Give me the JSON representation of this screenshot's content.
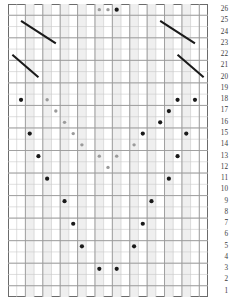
{
  "chart": {
    "columns": 23,
    "rows": 26,
    "cell_width": 8.7,
    "cell_height": 11.27,
    "grid_left": 8,
    "grid_top": 4,
    "colors": {
      "border": "#6b6b6b",
      "grid_line": "#c9c9c9",
      "major_line": "#9a9a9a",
      "shade_band": "#efefef",
      "dot_dark": "#1a1a1a",
      "dot_light": "#9b9b9b",
      "diagonal": "#1a1a1a",
      "label_text": "#3b3b3b",
      "background": "#ffffff"
    },
    "row_labels": [
      "26",
      "25",
      "24",
      "23",
      "22",
      "21",
      "20",
      "19",
      "18",
      "17",
      "16",
      "15",
      "14",
      "13",
      "12",
      "11",
      "10",
      "9",
      "8",
      "7",
      "6",
      "5",
      "4",
      "3",
      "2",
      "1"
    ],
    "shaded_columns": [
      3,
      5,
      7,
      9,
      11,
      13,
      15,
      17,
      19,
      21
    ],
    "major_column_lines": [
      1,
      3,
      5,
      7,
      9,
      11,
      13,
      15,
      17,
      19,
      21,
      23
    ],
    "major_row_lines": [
      26,
      24,
      22,
      20,
      18,
      16,
      14,
      12,
      10,
      8,
      6,
      4,
      2
    ],
    "symbols": {
      "dot_dark": {
        "name": "purl-dot",
        "radius": 2.1
      },
      "dot_light": {
        "name": "light-dot",
        "radius": 1.7
      },
      "diagonal": {
        "name": "decrease-line"
      }
    },
    "cells": [
      {
        "row": 26,
        "col": 11,
        "type": "dot_light"
      },
      {
        "row": 26,
        "col": 12,
        "type": "dot_light"
      },
      {
        "row": 26,
        "col": 13,
        "type": "dot_dark"
      },
      {
        "row": 18,
        "col": 2,
        "type": "dot_dark"
      },
      {
        "row": 18,
        "col": 5,
        "type": "dot_light"
      },
      {
        "row": 18,
        "col": 20,
        "type": "dot_dark"
      },
      {
        "row": 18,
        "col": 22,
        "type": "dot_dark"
      },
      {
        "row": 17,
        "col": 6,
        "type": "dot_light"
      },
      {
        "row": 17,
        "col": 19,
        "type": "dot_dark"
      },
      {
        "row": 16,
        "col": 7,
        "type": "dot_light"
      },
      {
        "row": 16,
        "col": 18,
        "type": "dot_dark"
      },
      {
        "row": 15,
        "col": 3,
        "type": "dot_dark"
      },
      {
        "row": 15,
        "col": 8,
        "type": "dot_light"
      },
      {
        "row": 15,
        "col": 16,
        "type": "dot_dark"
      },
      {
        "row": 15,
        "col": 21,
        "type": "dot_dark"
      },
      {
        "row": 14,
        "col": 9,
        "type": "dot_light"
      },
      {
        "row": 14,
        "col": 15,
        "type": "dot_light"
      },
      {
        "row": 13,
        "col": 4,
        "type": "dot_dark"
      },
      {
        "row": 13,
        "col": 11,
        "type": "dot_light"
      },
      {
        "row": 13,
        "col": 13,
        "type": "dot_light"
      },
      {
        "row": 13,
        "col": 20,
        "type": "dot_dark"
      },
      {
        "row": 12,
        "col": 12,
        "type": "dot_light"
      },
      {
        "row": 11,
        "col": 5,
        "type": "dot_dark"
      },
      {
        "row": 11,
        "col": 19,
        "type": "dot_dark"
      },
      {
        "row": 9,
        "col": 7,
        "type": "dot_dark"
      },
      {
        "row": 9,
        "col": 17,
        "type": "dot_dark"
      },
      {
        "row": 7,
        "col": 8,
        "type": "dot_dark"
      },
      {
        "row": 7,
        "col": 16,
        "type": "dot_dark"
      },
      {
        "row": 5,
        "col": 9,
        "type": "dot_dark"
      },
      {
        "row": 5,
        "col": 15,
        "type": "dot_dark"
      },
      {
        "row": 3,
        "col": 11,
        "type": "dot_dark"
      },
      {
        "row": 3,
        "col": 13,
        "type": "dot_dark"
      }
    ],
    "diagonals": [
      {
        "name": "decrease-upper-left",
        "x1_col": 2,
        "y1_row": 25,
        "x2_col": 6,
        "y2_row": 23
      },
      {
        "name": "decrease-lower-left",
        "x1_col": 1,
        "y1_row": 22,
        "x2_col": 4,
        "y2_row": 20
      },
      {
        "name": "decrease-upper-right",
        "x1_col": 18,
        "y1_row": 25,
        "x2_col": 22,
        "y2_row": 23
      },
      {
        "name": "decrease-lower-right",
        "x1_col": 20,
        "y1_row": 22,
        "x2_col": 23,
        "y2_row": 20
      }
    ]
  }
}
